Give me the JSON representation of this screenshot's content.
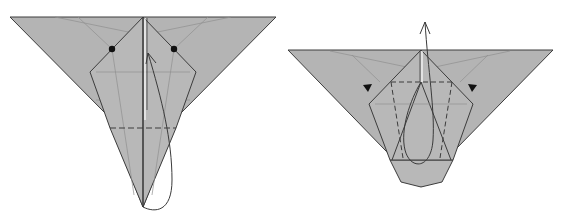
{
  "diagram": {
    "type": "origami-folding-steps",
    "colors": {
      "paper": "#b4b4b4",
      "edge": "#3c3c3c",
      "crease": "#8a8a8a",
      "arrow": "#3a3a3a",
      "marker": "#111111",
      "background": "#ffffff"
    },
    "steps": [
      {
        "name": "step-left",
        "markers": [
          "dot-left",
          "dot-right"
        ],
        "fold_line": "valley-fold-dashed",
        "arrow": "fold-up-arrow"
      },
      {
        "name": "step-right",
        "markers": [
          "push-triangle-left",
          "push-triangle-right"
        ],
        "fold_line": "valley-fold-dashed",
        "arrow": "unfold-up-arrow"
      }
    ]
  }
}
